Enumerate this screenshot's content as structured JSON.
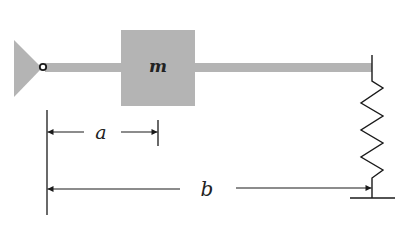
{
  "diagram": {
    "type": "mechanical-schematic",
    "colors": {
      "background": "#ffffff",
      "gray_fill": "#b4b4b4",
      "line": "#1a1a1a"
    },
    "mass": {
      "label": "m"
    },
    "dimensions": {
      "a": {
        "label": "a"
      },
      "b": {
        "label": "b"
      }
    },
    "components": [
      "pin-support",
      "pivot",
      "rigid-bar",
      "mass-block",
      "spring",
      "ground"
    ]
  }
}
